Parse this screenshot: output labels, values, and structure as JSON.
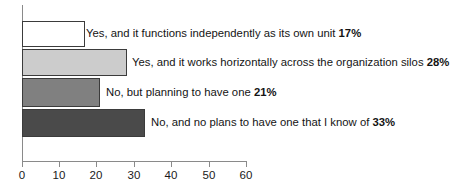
{
  "chart_data": {
    "type": "bar",
    "orientation": "horizontal",
    "title": "",
    "subtitle": "",
    "xlabel": "",
    "ylabel": "",
    "xlim": [
      0,
      60
    ],
    "grid": false,
    "legend": "none",
    "xticks": [
      "0",
      "10",
      "20",
      "30",
      "40",
      "50",
      "60"
    ],
    "xtick_values": [
      0,
      10,
      20,
      30,
      40,
      50,
      60
    ],
    "categories": [
      "Yes, and it functions independently as its own unit",
      "Yes, and it works horizontally across the organization silos",
      "No, but planning to have one",
      "No, and no plans to have one that I know of"
    ],
    "values": [
      17,
      28,
      21,
      33
    ],
    "value_labels": [
      "17%",
      "28%",
      "21%",
      "33%"
    ],
    "bar_colors": [
      "#ffffff",
      "#cccccc",
      "#808080",
      "#4a4a4a"
    ],
    "bar_border_color": "#3b3b3b",
    "axis_color": "#8a8a8a",
    "bars": [
      {
        "label": "Yes, and it functions independently as its own unit",
        "value_label": "17%",
        "value": 17,
        "color": "#ffffff"
      },
      {
        "label": "Yes, and it works horizontally across the organization silos",
        "value_label": "28%",
        "value": 28,
        "color": "#cccccc"
      },
      {
        "label": "No, but planning to have one",
        "value_label": "21%",
        "value": 21,
        "color": "#808080"
      },
      {
        "label": "No, and no plans to have one that I know of",
        "value_label": "33%",
        "value": 33,
        "color": "#4a4a4a"
      }
    ]
  }
}
